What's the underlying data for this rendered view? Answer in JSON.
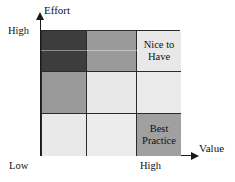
{
  "chart_data": {
    "type": "heatmap",
    "title": "",
    "xlabel": "Value",
    "ylabel": "Effort",
    "grid": true,
    "legend": "none",
    "x_tick_labels": [
      "Low",
      "High"
    ],
    "y_tick_labels": [
      "High"
    ],
    "columns": [
      "Low",
      "Medium",
      "High"
    ],
    "rows": [
      "High",
      "Medium",
      "Low"
    ],
    "cells": [
      {
        "row": "High",
        "col": "Low",
        "label": "",
        "shade": 0.76,
        "color": "#3d3d3d"
      },
      {
        "row": "High",
        "col": "Medium",
        "label": "",
        "shade": 0.4,
        "color": "#9a9a9a"
      },
      {
        "row": "High",
        "col": "High",
        "label": "Nice to Have",
        "shade": 0.09,
        "color": "#e8e8e8"
      },
      {
        "row": "Medium",
        "col": "Low",
        "label": "",
        "shade": 0.4,
        "color": "#9a9a9a"
      },
      {
        "row": "Medium",
        "col": "Medium",
        "label": "",
        "shade": 0.09,
        "color": "#e8e8e8"
      },
      {
        "row": "Medium",
        "col": "High",
        "label": "",
        "shade": 0.09,
        "color": "#eaeaea"
      },
      {
        "row": "Low",
        "col": "Low",
        "label": "",
        "shade": 0.09,
        "color": "#e9e9e9"
      },
      {
        "row": "Low",
        "col": "Medium",
        "label": "",
        "shade": 0.09,
        "color": "#ececec"
      },
      {
        "row": "Low",
        "col": "High",
        "label": "Best Practice",
        "shade": 0.37,
        "color": "#a0a0a0"
      }
    ]
  },
  "axes": {
    "y_title": "Effort",
    "x_title": "Value",
    "y_high": "High",
    "x_low": "Low",
    "x_high": "High"
  },
  "cell_labels": {
    "nice_to_have": "Nice to Have",
    "best_practice": "Best Practice"
  },
  "colors": {
    "axis": "#1a1a1a",
    "cell_border": "#2b2b2b",
    "dark": "#3d3d3d",
    "medium": "#9a9a9a",
    "medium_alt": "#a0a0a0",
    "light": "#e8e8e8",
    "background": "#ffffff"
  }
}
